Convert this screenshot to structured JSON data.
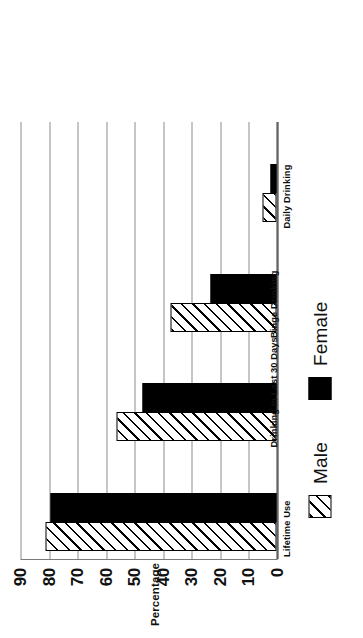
{
  "chart_data": {
    "type": "bar",
    "orientation": "vertical-rotated-90ccw",
    "title": "",
    "xlabel": "",
    "ylabel": "Percentage",
    "ylim": [
      0,
      90
    ],
    "ytick_step": 10,
    "grid": true,
    "legend_position": "below-axis",
    "categories": [
      "Lifetime Use",
      "Drinking In Last 30 Days",
      "Binge Drinking",
      "Daily Drinking"
    ],
    "tick_labels": [
      "0",
      "10",
      "20",
      "30",
      "40",
      "50",
      "60",
      "70",
      "80",
      "90"
    ],
    "series": [
      {
        "name": "Male",
        "pattern": "diagonal-hatch",
        "color": "#000000",
        "values": [
          81,
          56,
          37,
          5
        ]
      },
      {
        "name": "Female",
        "pattern": "solid-fill",
        "color": "#000000",
        "values": [
          79,
          47,
          23,
          2
        ]
      }
    ]
  },
  "legend": {
    "items": [
      {
        "label": "Male",
        "swatch": "hatched-swatch-icon"
      },
      {
        "label": "Female",
        "swatch": "solid-swatch-icon"
      }
    ]
  },
  "axis": {
    "title": "Percentage"
  }
}
